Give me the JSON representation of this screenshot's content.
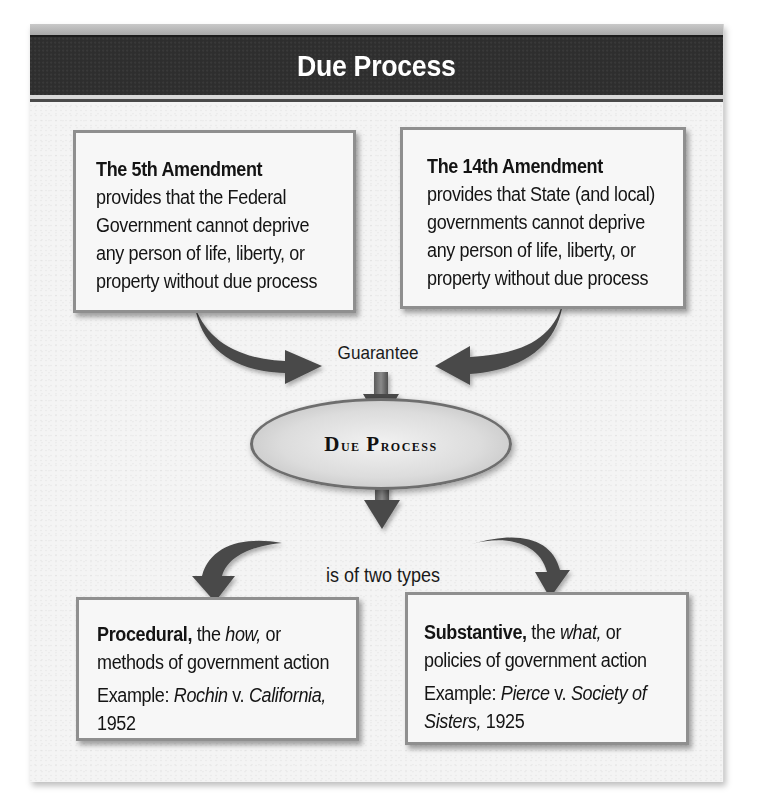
{
  "header": {
    "title": "Due Process"
  },
  "boxes": {
    "fifth_amendment": {
      "title": "The 5th Amendment",
      "lines": [
        "provides that the Federal",
        "Government cannot deprive",
        "any person of life, liberty, or",
        "property without due process"
      ]
    },
    "fourteenth_amendment": {
      "title": "The 14th Amendment",
      "lines": [
        "provides that State (and local)",
        "governments cannot deprive",
        "any person of life, liberty, or",
        "property without due process"
      ]
    },
    "procedural": {
      "title": "Procedural,",
      "title_rest_prefix": " the ",
      "title_rest_italic": "how,",
      "title_rest_suffix": " or",
      "line2": "methods of government action",
      "example_prefix": "Example: ",
      "case_party1": "Rochin",
      "case_v": " v. ",
      "case_party2": "California,",
      "year": "1952"
    },
    "substantive": {
      "title": "Substantive,",
      "title_rest_prefix": " the ",
      "title_rest_italic": "what,",
      "title_rest_suffix": " or",
      "line2": "policies of government action",
      "example_prefix": "Example: ",
      "case_party1": "Pierce",
      "case_v": " v. ",
      "case_party2": "Society of",
      "case_party2_cont": "Sisters,",
      "year": " 1925"
    }
  },
  "connectors": {
    "guarantee": "Guarantee",
    "two_types": "is of two types"
  },
  "center": {
    "label_first_cap": "D",
    "label_first_rest": "ue",
    "label_second_cap": "P",
    "label_second_rest": "rocess"
  },
  "colors": {
    "header_band": "#2e2e2e",
    "header_text": "#ffffff",
    "box_border": "#8f8f8f",
    "box_fill": "#f7f7f7",
    "arrow": "#4a4a4a",
    "ellipse_fill": "#dcdcdc",
    "background": "#f4f4f4"
  }
}
